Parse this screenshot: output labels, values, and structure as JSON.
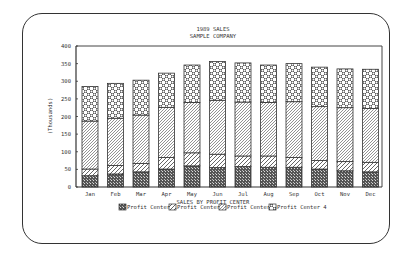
{
  "chart_data": {
    "type": "bar",
    "stacked": true,
    "title": "1989 SALES",
    "subtitle": "SAMPLE COMPANY",
    "xlabel": "SALES BY PROFIT CENTER",
    "ylabel": "(Thousands)",
    "ylim": [
      0,
      400
    ],
    "yticks": [
      0,
      50,
      100,
      150,
      200,
      250,
      300,
      350,
      400
    ],
    "grid": false,
    "legend_position": "bottom",
    "categories": [
      "Jan",
      "Feb",
      "Mar",
      "Apr",
      "May",
      "Jun",
      "Jul",
      "Aug",
      "Sep",
      "Oct",
      "Nov",
      "Dec"
    ],
    "series": [
      {
        "name": "Profit Center 1",
        "pattern": "dense-crosshatch",
        "values": [
          32,
          37,
          43,
          51,
          60,
          55,
          58,
          56,
          56,
          51,
          46,
          43
        ]
      },
      {
        "name": "Profit Center 2",
        "pattern": "diagonal-light",
        "values": [
          19,
          24,
          24,
          33,
          37,
          38,
          30,
          32,
          28,
          24,
          26,
          27
        ]
      },
      {
        "name": "Profit Center 3",
        "pattern": "diagonal-hatch",
        "values": [
          136,
          134,
          137,
          142,
          143,
          153,
          153,
          152,
          158,
          153,
          153,
          153
        ]
      },
      {
        "name": "Profit Center 4",
        "pattern": "checker",
        "values": [
          98,
          99,
          99,
          97,
          106,
          110,
          111,
          106,
          108,
          112,
          110,
          111
        ]
      }
    ],
    "totals": [
      285,
      294,
      303,
      323,
      346,
      356,
      352,
      346,
      350,
      340,
      335,
      334
    ]
  }
}
